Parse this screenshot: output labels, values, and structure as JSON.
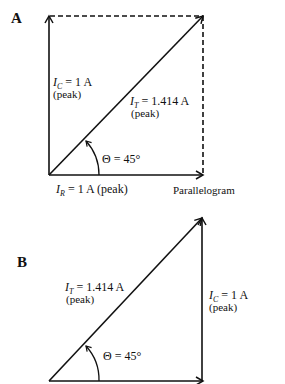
{
  "figure": {
    "panel_a": {
      "label": "A",
      "caption": "Parallelogram",
      "vectors": {
        "ic": {
          "symbol": "I",
          "subscript": "C",
          "value": "= 1 A",
          "note": "(peak)",
          "magnitude": 1,
          "unit": "A"
        },
        "it": {
          "symbol": "I",
          "subscript": "T",
          "value": "= 1.414 A",
          "note": "(peak)",
          "magnitude": 1.414,
          "unit": "A"
        },
        "ir": {
          "symbol": "I",
          "subscript": "R",
          "value": "= 1 A (peak)",
          "magnitude": 1,
          "unit": "A"
        }
      },
      "angle": {
        "text": "Θ = 45°",
        "degrees": 45
      }
    },
    "panel_b": {
      "label": "B",
      "vectors": {
        "it": {
          "symbol": "I",
          "subscript": "T",
          "value": "= 1.414 A",
          "note": "(peak)",
          "magnitude": 1.414,
          "unit": "A"
        },
        "ic": {
          "symbol": "I",
          "subscript": "C",
          "value": "= 1 A",
          "note": "(peak)",
          "magnitude": 1,
          "unit": "A"
        }
      },
      "angle": {
        "text": "Θ = 45°",
        "degrees": 45
      }
    }
  }
}
